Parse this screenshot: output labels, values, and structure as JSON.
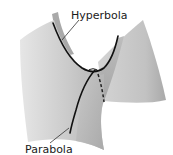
{
  "figure": {
    "labels": {
      "hyperbola": "Hyperbola",
      "parabola": "Parabola"
    },
    "colors": {
      "background": "#ffffff",
      "surface_light": "#d9d9d9",
      "surface_mid": "#bdbdbd",
      "surface_dark": "#9e9e9e",
      "curve": "#111111",
      "leader": "#333333"
    }
  }
}
